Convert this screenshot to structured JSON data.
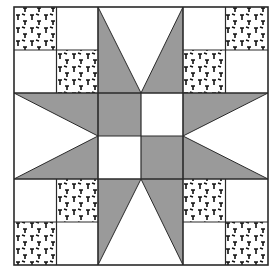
{
  "block": {
    "name": "Eight-pointed star quilt block",
    "grid": "6x6",
    "colors": {
      "background": "#ffffff",
      "fabric_gray": "#9a9a9a",
      "outline": "#2a2a2a",
      "print_motif": "#111111"
    },
    "regions": {
      "corners": "2x2 four-patch with printed squares on diagonal",
      "center": "2x2 four-patch of gray and white squares",
      "star_points": "pairs of gray triangles on each side"
    }
  }
}
